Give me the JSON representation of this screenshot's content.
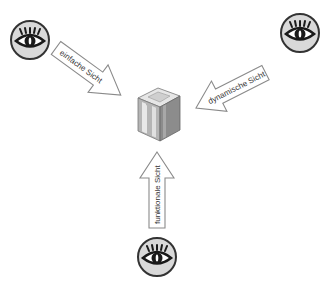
{
  "diagram": {
    "center": {
      "label": "",
      "icon": "server-cube-icon"
    },
    "views": [
      {
        "id": "einfache",
        "label": "einfache Sicht",
        "icon": "eye-icon",
        "position": "top-left"
      },
      {
        "id": "dynamische",
        "label": "dynamische Sicht",
        "icon": "eye-icon",
        "position": "top-right"
      },
      {
        "id": "funktionale",
        "label": "funktionale Sicht",
        "icon": "eye-icon",
        "position": "bottom"
      }
    ],
    "colors": {
      "eye_fill": "#d9d9d9",
      "eye_stroke": "#333333",
      "arrow_stroke": "#8a8a8a",
      "cube_light": "#e6e6e6",
      "cube_mid": "#b5b5b5",
      "cube_dark": "#8c8c8c"
    }
  }
}
